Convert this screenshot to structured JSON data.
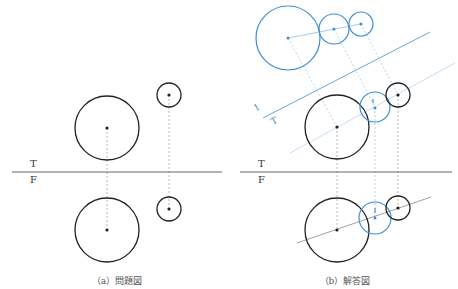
{
  "colors": {
    "ink": "#222222",
    "blue": "#3d8fd6",
    "light_blue": "#8fbce6",
    "gray_line": "#888888"
  },
  "panel_a": {
    "caption": "（a）問題図",
    "label_top": "T",
    "label_front": "F",
    "ground_line": {
      "x1": 12,
      "x2": 222,
      "y": 172
    },
    "circles": [
      {
        "id": "large-top",
        "cx": 107,
        "cy": 128,
        "r": 32
      },
      {
        "id": "small-top",
        "cx": 169,
        "cy": 95,
        "r": 12
      },
      {
        "id": "large-front",
        "cx": 107,
        "cy": 230,
        "r": 32
      },
      {
        "id": "small-front",
        "cx": 169,
        "cy": 209,
        "r": 12
      }
    ]
  },
  "panel_b": {
    "caption": "（b）解答図",
    "label_top": "T",
    "label_front": "F",
    "aux_label_1": "1",
    "aux_label_T": "T",
    "ground_line": {
      "x1": 240,
      "x2": 452,
      "y": 172
    }
  }
}
